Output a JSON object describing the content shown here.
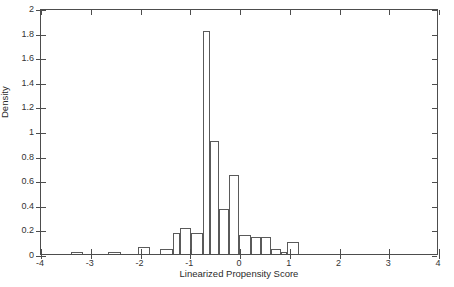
{
  "chart_data": {
    "type": "bar",
    "title": "",
    "subtitle": "",
    "xlabel": "Linearized Propensity Score",
    "ylabel": "Density",
    "xlim": [
      -4,
      4
    ],
    "ylim": [
      0,
      2
    ],
    "xticks": [
      -4,
      -3,
      -2,
      -1,
      0,
      1,
      2,
      3,
      4
    ],
    "xticklabels": [
      "-4",
      "-3",
      "-2",
      "-1",
      "0",
      "1",
      "2",
      "3",
      "4"
    ],
    "yticks": [
      0,
      0.2,
      0.4,
      0.6,
      0.8,
      1,
      1.2,
      1.4,
      1.6,
      1.8,
      2
    ],
    "yticklabels": [
      "0",
      "0.2",
      "0.4",
      "0.6",
      "0.8",
      "1",
      "1.2",
      "1.4",
      "1.6",
      "1.8",
      "2"
    ],
    "grid": false,
    "legend": null,
    "bin_width": 0.25,
    "bars": [
      {
        "x0": -3.4,
        "x1": -3.15,
        "value": 0.02
      },
      {
        "x0": -2.65,
        "x1": -2.4,
        "value": 0.02
      },
      {
        "x0": -2.05,
        "x1": -1.8,
        "value": 0.06
      },
      {
        "x0": -1.6,
        "x1": -1.35,
        "value": 0.04
      },
      {
        "x0": -1.35,
        "x1": -1.2,
        "value": 0.17
      },
      {
        "x0": -1.2,
        "x1": -0.98,
        "value": 0.21
      },
      {
        "x0": -0.98,
        "x1": -0.75,
        "value": 0.17
      },
      {
        "x0": -0.75,
        "x1": -0.6,
        "value": 1.81
      },
      {
        "x0": -0.6,
        "x1": -0.43,
        "value": 0.92
      },
      {
        "x0": -0.43,
        "x1": -0.22,
        "value": 0.37
      },
      {
        "x0": -0.22,
        "x1": -0.02,
        "value": 0.64
      },
      {
        "x0": -0.02,
        "x1": 0.22,
        "value": 0.155
      },
      {
        "x0": 0.22,
        "x1": 0.42,
        "value": 0.135
      },
      {
        "x0": 0.42,
        "x1": 0.62,
        "value": 0.135
      },
      {
        "x0": 0.62,
        "x1": 0.82,
        "value": 0.04
      },
      {
        "x0": 0.82,
        "x1": 0.95,
        "value": 0.015
      },
      {
        "x0": 0.95,
        "x1": 1.18,
        "value": 0.095
      }
    ],
    "colors": {
      "bar_edge": "#5a5a5a",
      "bar_fill": "none",
      "axis": "#4d4d4d",
      "text": "#2b2b2b",
      "background": "#ffffff"
    }
  }
}
